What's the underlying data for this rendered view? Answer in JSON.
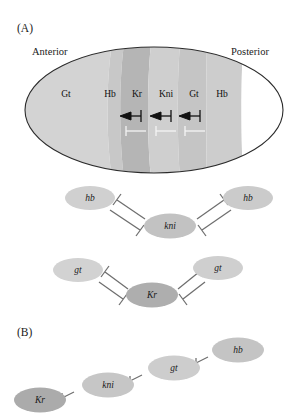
{
  "figure": {
    "panels": [
      {
        "id": "A",
        "label": "(A)"
      },
      {
        "id": "B",
        "label": "(B)"
      }
    ]
  },
  "panel_a": {
    "label": "(A)",
    "orientation": {
      "anterior": "Anterior",
      "posterior": "Posterior"
    },
    "embryo": {
      "shape": "ellipse",
      "cx": 154,
      "cy": 110,
      "rx": 129,
      "ry": 63,
      "outline_color": "#2b2b2b"
    },
    "expression_domains": [
      {
        "name": "Gt",
        "label": "Gt",
        "x": 66,
        "y": 94,
        "band_color": "#d2d2d2"
      },
      {
        "name": "Hb",
        "label": "Hb",
        "x": 109,
        "y": 94,
        "band_color": "#c9c9c9"
      },
      {
        "name": "Kr",
        "label": "Kr",
        "x": 136,
        "y": 94,
        "band_color": "#b6b6b6"
      },
      {
        "name": "Kni",
        "label": "Kni",
        "x": 165,
        "y": 94,
        "band_color": "#cfcfcf"
      },
      {
        "name": "Gt",
        "label": "Gt",
        "x": 193,
        "y": 94,
        "band_color": "#c6c6c6"
      },
      {
        "name": "Hb",
        "label": "Hb",
        "x": 222,
        "y": 94,
        "band_color": "#cccccc"
      }
    ],
    "interactions": [
      {
        "from": "Kni",
        "to": "Kr",
        "type": "repression",
        "direction": "left",
        "row": "upper"
      },
      {
        "from": "Gt",
        "to": "Kni",
        "type": "repression",
        "direction": "left",
        "row": "upper"
      },
      {
        "from": "Hb",
        "to": "Gt",
        "type": "repression",
        "direction": "left",
        "row": "upper"
      },
      {
        "from": "Kr",
        "to": "Kni",
        "type": "repression",
        "direction": "right",
        "row": "lower"
      },
      {
        "from": "Kni",
        "to": "Gt",
        "type": "repression",
        "direction": "right",
        "row": "lower"
      },
      {
        "from": "Gt",
        "to": "Hb",
        "type": "repression",
        "direction": "right",
        "row": "lower"
      }
    ],
    "network_upper": {
      "nodes": [
        {
          "name": "hb-left",
          "label": "hb",
          "cx": 90,
          "cy": 198,
          "rx": 25,
          "ry": 12,
          "fill": "#d0d0d0"
        },
        {
          "name": "kni",
          "label": "kni",
          "cx": 170,
          "cy": 226,
          "rx": 26,
          "ry": 12.5,
          "fill": "#c2c2c2"
        },
        {
          "name": "hb-right",
          "label": "hb",
          "cx": 248,
          "cy": 198,
          "rx": 25,
          "ry": 12,
          "fill": "#cbcbcb"
        }
      ],
      "edges": [
        {
          "from": "hb-left",
          "to": "kni",
          "type": "mutual-repression"
        },
        {
          "from": "kni",
          "to": "hb-right",
          "type": "mutual-repression"
        }
      ]
    },
    "network_lower": {
      "nodes": [
        {
          "name": "gt-left",
          "label": "gt",
          "cx": 78,
          "cy": 270,
          "rx": 25,
          "ry": 12,
          "fill": "#d2d2d2"
        },
        {
          "name": "Kr",
          "label": "Kr",
          "cx": 152,
          "cy": 295,
          "rx": 26,
          "ry": 12.5,
          "fill": "#aeaeae"
        },
        {
          "name": "gt-right",
          "label": "gt",
          "cx": 218,
          "cy": 268,
          "rx": 25,
          "ry": 12,
          "fill": "#cfcfcf"
        }
      ],
      "edges": [
        {
          "from": "gt-left",
          "to": "Kr",
          "type": "mutual-repression"
        },
        {
          "from": "Kr",
          "to": "gt-right",
          "type": "mutual-repression"
        }
      ]
    }
  },
  "panel_b": {
    "label": "(B)",
    "chain": {
      "nodes": [
        {
          "name": "Kr",
          "label": "Kr",
          "cx": 40,
          "cy": 400,
          "rx": 26,
          "ry": 12.5,
          "fill": "#ababab"
        },
        {
          "name": "kni",
          "label": "kni",
          "cx": 108,
          "cy": 385,
          "rx": 26,
          "ry": 12.5,
          "fill": "#c6c6c6"
        },
        {
          "name": "gt",
          "label": "gt",
          "cx": 174,
          "cy": 368,
          "rx": 26,
          "ry": 12.5,
          "fill": "#cdcdcd"
        },
        {
          "name": "hb",
          "label": "hb",
          "cx": 238,
          "cy": 350,
          "rx": 26,
          "ry": 12.5,
          "fill": "#c4c4c4"
        }
      ],
      "edges": [
        {
          "from": "kni",
          "to": "Kr",
          "type": "repression"
        },
        {
          "from": "gt",
          "to": "kni",
          "type": "repression"
        },
        {
          "from": "hb",
          "to": "gt",
          "type": "repression"
        }
      ]
    }
  },
  "colors": {
    "background": "#ffffff",
    "outline": "#2b2b2b",
    "edge": "#6e6e6e",
    "text": "#1a1a1a",
    "band_light": "#d2d2d2",
    "band_dark": "#b6b6b6",
    "node_dark": "#aeaeae"
  }
}
